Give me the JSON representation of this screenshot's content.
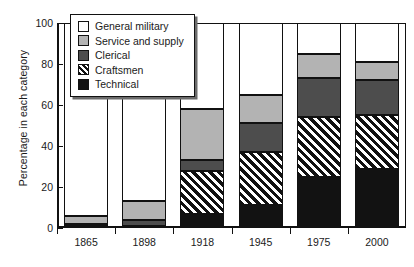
{
  "chart_data": {
    "type": "bar",
    "stacked": true,
    "title": "",
    "xlabel": "",
    "ylabel": "Percentage in each category",
    "categories": [
      "1865",
      "1898",
      "1918",
      "1945",
      "1975",
      "2000"
    ],
    "ylim": [
      0,
      100
    ],
    "yticks": [
      0,
      20,
      40,
      60,
      80,
      100
    ],
    "ytick_labels": [
      "0",
      "20",
      "40",
      "60",
      "80",
      "100"
    ],
    "grid": false,
    "legend_position": "top-left-inside",
    "series": [
      {
        "name": "Technical",
        "key": "technical",
        "color": "#121212",
        "pattern": "solid",
        "values": [
          1,
          1,
          7,
          11,
          25,
          29
        ]
      },
      {
        "name": "Craftsmen",
        "key": "craftsmen",
        "color": "#111111",
        "pattern": "diagonal-hatch",
        "values": [
          0,
          0,
          21,
          26,
          29,
          26
        ]
      },
      {
        "name": "Clerical",
        "key": "clerical",
        "color": "#4d4d4d",
        "pattern": "solid",
        "values": [
          1,
          3,
          5,
          14,
          19,
          17
        ]
      },
      {
        "name": "Service and supply",
        "key": "service",
        "color": "#b3b3b3",
        "pattern": "solid",
        "values": [
          4,
          9,
          25,
          14,
          12,
          9
        ]
      },
      {
        "name": "General military",
        "key": "general",
        "color": "#ffffff",
        "pattern": "solid",
        "values": [
          94,
          87,
          42,
          35,
          15,
          19
        ]
      }
    ],
    "cumulative_tops": {
      "1865": {
        "technical": 1,
        "craftsmen": 1,
        "clerical": 2,
        "service": 6,
        "general": 100
      },
      "1898": {
        "technical": 1,
        "craftsmen": 1,
        "clerical": 4,
        "service": 13,
        "general": 100
      },
      "1918": {
        "technical": 7,
        "craftsmen": 28,
        "clerical": 33,
        "service": 58,
        "general": 100
      },
      "1945": {
        "technical": 11,
        "craftsmen": 37,
        "clerical": 51,
        "service": 65,
        "general": 100
      },
      "1975": {
        "technical": 25,
        "craftsmen": 54,
        "clerical": 73,
        "service": 85,
        "general": 100
      },
      "2000": {
        "technical": 29,
        "craftsmen": 55,
        "clerical": 72,
        "service": 81,
        "general": 100
      }
    }
  },
  "legend": {
    "items": [
      {
        "label": "General military",
        "key": "general"
      },
      {
        "label": "Service and supply",
        "key": "service"
      },
      {
        "label": "Clerical",
        "key": "clerical"
      },
      {
        "label": "Craftsmen",
        "key": "craftsmen"
      },
      {
        "label": "Technical",
        "key": "technical"
      }
    ]
  }
}
